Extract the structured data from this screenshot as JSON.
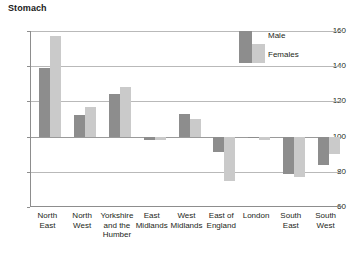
{
  "chart_data": {
    "type": "bar",
    "title": "Stomach",
    "xlabel": "",
    "ylabel": "",
    "ylim": [
      60,
      160
    ],
    "yticks": [
      60,
      80,
      100,
      120,
      140,
      160
    ],
    "baseline": 100,
    "grid": true,
    "legend_position": "top-right",
    "categories": [
      "North East",
      "North West",
      "Yorkshire and the Humber",
      "East Midlands",
      "West Midlands",
      "East of England",
      "London",
      "South East",
      "South West"
    ],
    "category_lines": [
      [
        "North",
        "East"
      ],
      [
        "North",
        "West"
      ],
      [
        "Yorkshire",
        "and the",
        "Humber"
      ],
      [
        "East",
        "Midlands"
      ],
      [
        "West",
        "Midlands"
      ],
      [
        "East of",
        "England"
      ],
      [
        "London"
      ],
      [
        "South",
        "East"
      ],
      [
        "South",
        "West"
      ]
    ],
    "series": [
      {
        "name": "Male",
        "color": "#8d8d8d",
        "values": [
          139,
          112,
          124,
          98,
          113,
          91,
          99,
          79,
          84
        ]
      },
      {
        "name": "Females",
        "color": "#cacaca",
        "values": [
          157,
          117,
          128,
          98,
          110,
          75,
          98,
          77,
          90
        ]
      }
    ]
  },
  "legend": {
    "male_label": "Male",
    "female_label": "Females"
  },
  "axis": {
    "tick_160": "160",
    "tick_140": "140",
    "tick_120": "120",
    "tick_100": "100",
    "tick_80": "80",
    "tick_60": "60"
  }
}
